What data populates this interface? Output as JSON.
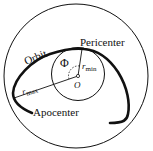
{
  "diagram": {
    "labels": {
      "orbit": "Orbit",
      "pericenter": "Pericenter",
      "apocenter": "Apocenter",
      "angle": "Φ",
      "r_min": "r",
      "r_min_sub": "min",
      "r_max": "r",
      "r_max_sub": "max",
      "center": "O"
    },
    "colors": {
      "stroke": "#111111",
      "background": "#ffffff"
    }
  }
}
